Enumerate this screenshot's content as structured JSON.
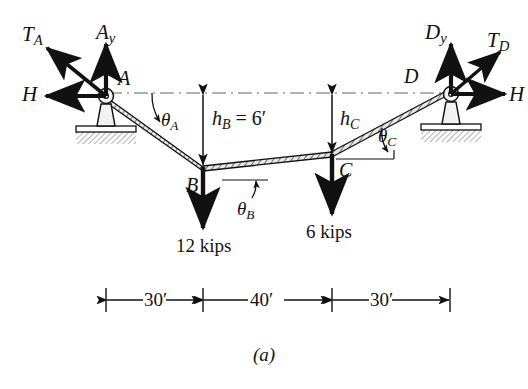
{
  "figure": {
    "caption": "(a)",
    "type": "cable-free-body-diagram",
    "background_color": "#ffffff",
    "ink_color": "#111111",
    "ground_hatch_color": "#8a8a8a"
  },
  "joints": {
    "A": {
      "label": "A",
      "kind": "pin-support"
    },
    "B": {
      "label": "B",
      "kind": "load-point"
    },
    "C": {
      "label": "C",
      "kind": "load-point"
    },
    "D": {
      "label": "D",
      "kind": "pin-support"
    }
  },
  "forces": {
    "tension_A": {
      "label": "T",
      "sub": "A",
      "direction": "up-left"
    },
    "reaction_Ay": {
      "label": "A",
      "sub": "y",
      "direction": "up"
    },
    "reaction_H_left": {
      "label": "H",
      "sub": "",
      "direction": "left"
    },
    "tension_D": {
      "label": "T",
      "sub": "D",
      "direction": "up-right"
    },
    "reaction_Dy": {
      "label": "D",
      "sub": "y",
      "direction": "up"
    },
    "reaction_H_right": {
      "label": "H",
      "sub": "",
      "direction": "right"
    }
  },
  "loads": [
    {
      "name": "load-at-B",
      "value": "12 kips",
      "direction": "down"
    },
    {
      "name": "load-at-C",
      "value": "6 kips",
      "direction": "down"
    }
  ],
  "angles": [
    {
      "name": "theta-A",
      "label": "θ",
      "sub": "A"
    },
    {
      "name": "theta-B",
      "label": "θ",
      "sub": "B"
    },
    {
      "name": "theta-C",
      "label": "θ",
      "sub": "C"
    }
  ],
  "heights": [
    {
      "name": "h-B",
      "label": "h",
      "sub": "B",
      "equals": "= 6′"
    },
    {
      "name": "h-C",
      "label": "h",
      "sub": "C",
      "equals": ""
    }
  ],
  "dimensions": {
    "segments": [
      {
        "name": "span-AB",
        "value": "30′"
      },
      {
        "name": "span-BC",
        "value": "40′"
      },
      {
        "name": "span-CD",
        "value": "30′"
      }
    ]
  }
}
